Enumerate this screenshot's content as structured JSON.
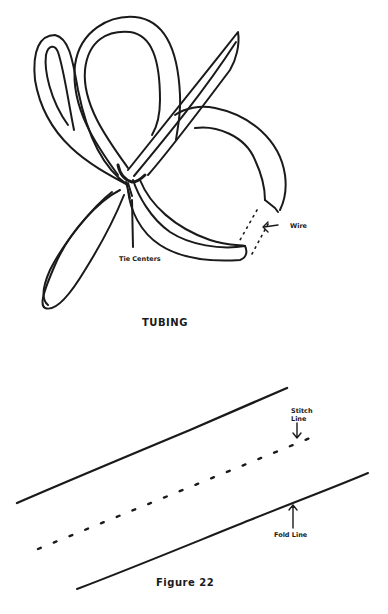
{
  "figure_top": {
    "title": "TUBING",
    "labels": {
      "tie_centers": "Tie Centers",
      "wire": "Wire"
    }
  },
  "figure_bottom": {
    "caption": "Figure 22",
    "labels": {
      "stitch_line_1": "Stitch",
      "stitch_line_2": "Line",
      "fold_line": "Fold Line"
    }
  },
  "colors": {
    "ink": "#1a1a1a",
    "paper": "#ffffff"
  }
}
